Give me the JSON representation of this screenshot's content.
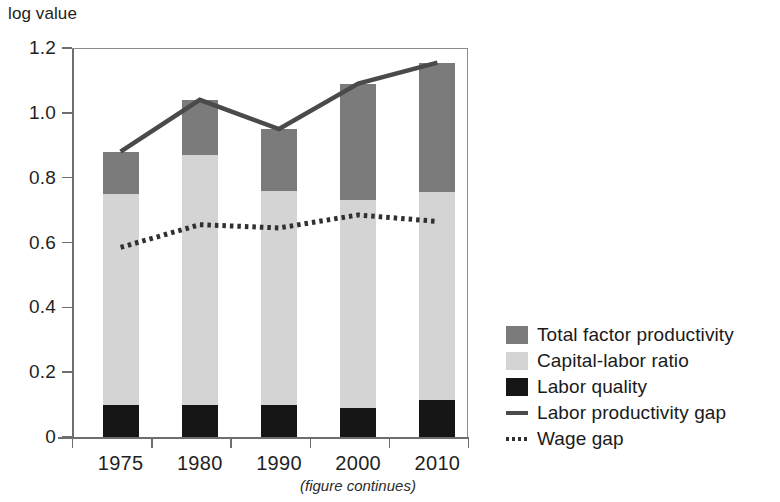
{
  "chart_data": {
    "type": "bar",
    "title": "",
    "subtitle": "",
    "xlabel": "",
    "ylabel": "log value",
    "categories": [
      "1975",
      "1980",
      "1990",
      "2000",
      "2010"
    ],
    "ylim": [
      0,
      1.2
    ],
    "yticks": [
      "0",
      "0.2",
      "0.4",
      "0.6",
      "0.8",
      "1.0",
      "1.2"
    ],
    "ytick_values": [
      0,
      0.2,
      0.4,
      0.6,
      0.8,
      1.0,
      1.2
    ],
    "grid": false,
    "stacked": true,
    "legend_position": "right",
    "series": [
      {
        "name": "Labor quality",
        "kind": "bar-segment",
        "color": "#161616",
        "values": [
          0.1,
          0.1,
          0.1,
          0.09,
          0.115
        ]
      },
      {
        "name": "Capital-labor ratio",
        "kind": "bar-segment",
        "color": "#d4d4d4",
        "values": [
          0.65,
          0.77,
          0.66,
          0.64,
          0.64
        ]
      },
      {
        "name": "Total factor productivity",
        "kind": "bar-segment",
        "color": "#7b7b7b",
        "values": [
          0.13,
          0.17,
          0.19,
          0.36,
          0.4
        ]
      },
      {
        "name": "Labor productivity gap",
        "kind": "line",
        "style": "solid",
        "color": "#4a4a4a",
        "values": [
          0.88,
          1.04,
          0.95,
          1.09,
          1.155
        ]
      },
      {
        "name": "Wage gap",
        "kind": "line",
        "style": "dotted",
        "color": "#303030",
        "values": [
          0.585,
          0.655,
          0.645,
          0.685,
          0.665
        ]
      }
    ],
    "stack_tops": [
      0.88,
      1.04,
      0.95,
      1.09,
      1.155
    ],
    "annotations": [
      "(figure continues)"
    ]
  },
  "axis": {
    "y_title": "log value"
  },
  "legend": {
    "items": [
      {
        "label": "Total factor productivity",
        "key": "swatch",
        "color": "#7b7b7b"
      },
      {
        "label": "Capital-labor ratio",
        "key": "swatch",
        "color": "#d4d4d4"
      },
      {
        "label": "Labor quality",
        "key": "swatch",
        "color": "#161616"
      },
      {
        "label": "Labor productivity gap",
        "key": "solid-line",
        "color": "#4a4a4a"
      },
      {
        "label": "Wage gap",
        "key": "dotted-line",
        "color": "#303030"
      }
    ]
  },
  "footnote": {
    "text": "(figure continues)"
  }
}
